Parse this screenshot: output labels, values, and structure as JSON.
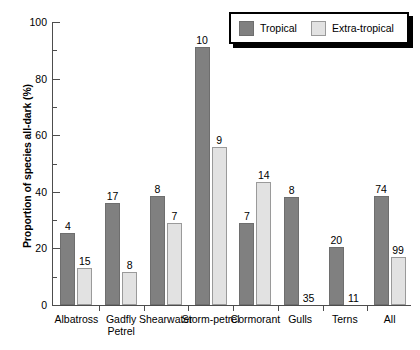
{
  "chart_data": {
    "type": "bar",
    "title": "",
    "xlabel": "",
    "ylabel": "Proportion of species all-dark (%)",
    "ylim": [
      0,
      100
    ],
    "ytick_labels": [
      "0",
      "20",
      "40",
      "60",
      "80",
      "100"
    ],
    "ytick_values": [
      0,
      20,
      40,
      60,
      80,
      100
    ],
    "yminor_values": [
      10,
      30,
      50,
      70,
      90
    ],
    "grid": false,
    "legend_position": "top-right",
    "categories": [
      "Albatross",
      "Gadfly Petrel",
      "Shearwater",
      "Storm-petrel",
      "Cormorant",
      "Gulls",
      "Terns",
      "All"
    ],
    "category_lines": [
      [
        "Albatross"
      ],
      [
        "Gadfly",
        "Petrel"
      ],
      [
        "Shearwater"
      ],
      [
        "Storm-petrel"
      ],
      [
        "Cormorant"
      ],
      [
        "Gulls"
      ],
      [
        "Terns"
      ],
      [
        "All"
      ]
    ],
    "series": [
      {
        "name": "Tropical",
        "color": "#808080",
        "values": [
          25.5,
          36.0,
          38.5,
          91.0,
          29.0,
          38.0,
          20.5,
          38.5
        ],
        "sample_sizes": [
          4,
          17,
          8,
          10,
          7,
          8,
          20,
          74
        ]
      },
      {
        "name": "Extra-tropical",
        "color": "#e2e2e2",
        "values": [
          13.0,
          11.5,
          29.0,
          56.0,
          43.5,
          0,
          0,
          17.0
        ],
        "sample_sizes": [
          15,
          8,
          7,
          9,
          14,
          35,
          11,
          99
        ]
      }
    ]
  },
  "legend": {
    "items": [
      {
        "label": "Tropical"
      },
      {
        "label": "Extra-tropical"
      }
    ]
  }
}
